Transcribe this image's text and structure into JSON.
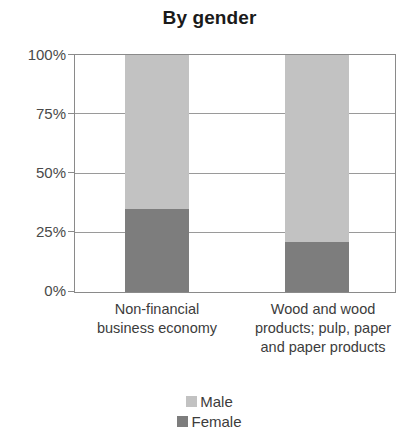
{
  "chart_data": {
    "type": "bar",
    "title": "By gender",
    "subtitle": "",
    "xlabel": "",
    "ylabel": "",
    "ylim": [
      0,
      100
    ],
    "stacked": true,
    "stack_total_percent": 100,
    "orientation": "vertical",
    "grid": true,
    "grid_axis": "y",
    "legend_position": "bottom",
    "categories": [
      "Non-financial business economy",
      "Wood and wood products; pulp, paper and paper products"
    ],
    "series": [
      {
        "name": "Male",
        "color": "#c2c2c2",
        "values": [
          65,
          79
        ]
      },
      {
        "name": "Female",
        "color": "#7d7d7d",
        "values": [
          35,
          21
        ]
      }
    ],
    "y_ticks": [
      0,
      25,
      50,
      75,
      100
    ],
    "y_tick_labels": [
      "0%",
      "25%",
      "50%",
      "75%",
      "100%"
    ],
    "annotations": []
  },
  "axis": {
    "y_tick_labels": [
      "100%",
      "75%",
      "50%",
      "25%",
      "0%"
    ]
  },
  "categories_display": [
    "Non-financial\nbusiness economy",
    "Wood and wood\nproducts; pulp, paper\nand paper products"
  ],
  "legend": {
    "items": [
      {
        "label": "Male",
        "color": "#c2c2c2"
      },
      {
        "label": "Female",
        "color": "#7d7d7d"
      }
    ]
  },
  "colors": {
    "male": "#c2c2c2",
    "female": "#7d7d7d",
    "axis_line": "#8a8a8a",
    "gridline": "#9a9a9a",
    "text": "#3c3c3c",
    "title_text": "#1a1a1a",
    "background": "#ffffff"
  }
}
